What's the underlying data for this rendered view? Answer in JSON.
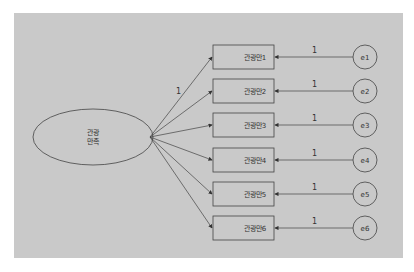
{
  "diagram": {
    "type": "sem-measurement-model",
    "latent": {
      "label_line1": "관광",
      "label_line2": "만족",
      "cx": 93,
      "cy": 137,
      "rx": 60,
      "ry": 28
    },
    "loading_label": "1",
    "indicators": [
      {
        "label": "관광만1",
        "error": "e1",
        "path_label": "1",
        "cy": 57
      },
      {
        "label": "관광만2",
        "error": "e2",
        "path_label": "1",
        "cy": 91
      },
      {
        "label": "관광만3",
        "error": "e3",
        "path_label": "1",
        "cy": 125
      },
      {
        "label": "관광만4",
        "error": "e4",
        "path_label": "1",
        "cy": 160
      },
      {
        "label": "관광만5",
        "error": "e5",
        "path_label": "1",
        "cy": 194
      },
      {
        "label": "관광만6",
        "error": "e6",
        "path_label": "1",
        "cy": 228
      }
    ],
    "colors": {
      "background": "#c9c9c9",
      "stroke": "#444444",
      "text": "#333333"
    }
  }
}
